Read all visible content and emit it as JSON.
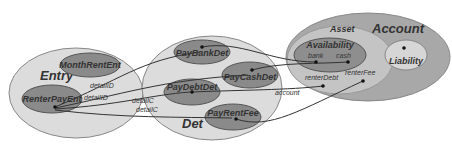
{
  "diagram": {
    "groups": {
      "entry": {
        "label": "Entry"
      },
      "det": {
        "label": "Det"
      },
      "account": {
        "label": "Account"
      },
      "asset": {
        "label": "Asset"
      },
      "availability": {
        "label": "Availability"
      }
    },
    "nodes": {
      "month_rent_ent": {
        "label": "MonthRentEnt"
      },
      "renter_pay_ent": {
        "label": "RenterPayEnt"
      },
      "pay_bank_det": {
        "label": "PayBankDet"
      },
      "pay_cash_det": {
        "label": "PayCashDet"
      },
      "pay_debt_det": {
        "label": "PayDebtDet"
      },
      "pay_rent_fee": {
        "label": "PayRentFee"
      },
      "liability": {
        "label": "Liability"
      }
    },
    "ports": {
      "bank": "bank",
      "cash": "cash",
      "renter_debt": "renterDebt",
      "renter_fee": "renterFee"
    },
    "edge_labels": {
      "detail_id_1": "detailID",
      "detail_id_2": "detailID",
      "detail_c_1": "detailC",
      "detail_c_2": "detailC",
      "account": "account"
    },
    "colors": {
      "group_fill": "#dcdcdc",
      "node_fill": "#8a8a8a",
      "account_fill": "#a8a8a8",
      "asset_fill": "#c4c4c4",
      "availability_fill": "#8e8e8e",
      "stroke": "#555555"
    }
  }
}
